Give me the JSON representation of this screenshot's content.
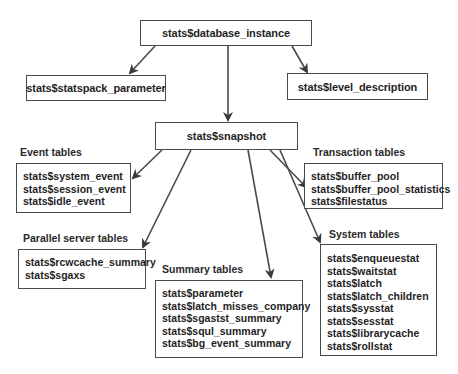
{
  "nodes": {
    "database_instance": "stats$database_instance",
    "statspack_parameter": "stats$statspack_parameter",
    "level_description": "stats$level_description",
    "snapshot": "stats$snapshot"
  },
  "groups": {
    "event": {
      "label": "Event tables",
      "items": [
        "stats$system_event",
        "stats$session_event",
        "stats$idle_event"
      ]
    },
    "transaction": {
      "label": "Transaction tables",
      "items": [
        "stats$buffer_pool",
        "stats$buffer_pool_statistics",
        "stats$filestatus"
      ]
    },
    "parallel": {
      "label": "Parallel server tables",
      "items": [
        "stats$rcwcache_summary",
        "stats$sgaxs"
      ]
    },
    "summary": {
      "label": "Summary tables",
      "items": [
        "stats$parameter",
        "stats$latch_misses_company",
        "stats$sgastst_summary",
        "stats$squl_summary",
        "stats$bg_event_summary"
      ]
    },
    "system": {
      "label": "System tables",
      "items": [
        "stats$enqueuestat",
        "stats$waitstat",
        "stats$latch",
        "stats$latch_children",
        "stats$sysstat",
        "stats$sesstat",
        "stats$librarycache",
        "stats$rollstat"
      ]
    }
  },
  "edges": [
    {
      "from": "database_instance",
      "to": "statspack_parameter"
    },
    {
      "from": "database_instance",
      "to": "snapshot"
    },
    {
      "from": "database_instance",
      "to": "level_description"
    },
    {
      "from": "snapshot",
      "to": "event"
    },
    {
      "from": "snapshot",
      "to": "parallel"
    },
    {
      "from": "snapshot",
      "to": "summary"
    },
    {
      "from": "snapshot",
      "to": "transaction"
    },
    {
      "from": "snapshot",
      "to": "system"
    }
  ]
}
